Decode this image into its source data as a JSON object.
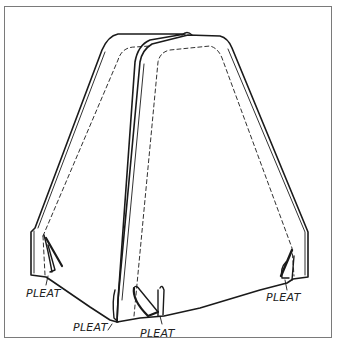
{
  "figure": {
    "type": "line-drawing",
    "labels": [
      {
        "text": "PLEAT",
        "x": 26,
        "y": 297
      },
      {
        "text": "PLEAT",
        "x": 73,
        "y": 331
      },
      {
        "text": "PLEAT",
        "x": 140,
        "y": 337
      },
      {
        "text": "PLEAT",
        "x": 266,
        "y": 301
      }
    ],
    "colors": {
      "ink": "#1a1a1a",
      "frame": "#7a7a7a",
      "background": "#ffffff"
    }
  }
}
